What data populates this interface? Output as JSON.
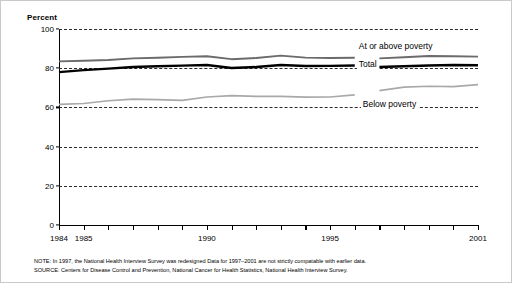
{
  "chart_data": {
    "type": "line",
    "title": "",
    "ylabel": "Percent",
    "xlabel": "",
    "ylim": [
      0,
      100
    ],
    "yticks": [
      0,
      20,
      40,
      60,
      80,
      100
    ],
    "ytick_labels": [
      "0",
      "20",
      "40",
      "60",
      "80",
      "100"
    ],
    "grid": "horizontal-dashed",
    "xlim": [
      1984,
      2001
    ],
    "x": [
      1984,
      1985,
      1986,
      1987,
      1988,
      1989,
      1990,
      1991,
      1992,
      1993,
      1994,
      1995,
      1996,
      1997,
      1998,
      1999,
      2000,
      2001
    ],
    "xticks": [
      1984,
      1985,
      1986,
      1987,
      1988,
      1989,
      1990,
      1991,
      1992,
      1993,
      1994,
      1995,
      1996,
      1997,
      1998,
      1999,
      2000,
      2001
    ],
    "xtick_labels_shown": [
      "1984",
      "1985",
      "1990",
      "1995",
      "2001"
    ],
    "legend_position": "inline-right",
    "series_break_year": 1997,
    "series": [
      {
        "name": "At or above poverty",
        "color": "#6b6b6b",
        "values": [
          83.5,
          83.8,
          84.2,
          85.0,
          85.3,
          85.8,
          86.1,
          84.6,
          85.2,
          86.4,
          85.4,
          85.2,
          85.3,
          85.0,
          85.6,
          86.2,
          86.1,
          85.9
        ]
      },
      {
        "name": "Total",
        "color": "#000000",
        "values": [
          78.0,
          79.0,
          79.8,
          80.6,
          81.0,
          81.3,
          81.6,
          80.1,
          80.6,
          81.6,
          81.1,
          81.2,
          81.4,
          80.6,
          81.0,
          81.4,
          81.6,
          81.5
        ]
      },
      {
        "name": "Below poverty",
        "color": "#a9a9a9",
        "values": [
          61.5,
          62.0,
          63.4,
          64.2,
          64.0,
          63.6,
          65.3,
          66.0,
          65.6,
          65.6,
          65.2,
          65.3,
          66.4,
          68.6,
          70.3,
          70.8,
          70.6,
          71.6
        ]
      }
    ]
  },
  "footnotes": {
    "note": "NOTE: In 1997, the National Health Interview Survey was redesigned Data for 1997–2001 are not strictly compatable with earlier data.",
    "source": "SOURCE: Centers for Disease Control and Prevention, National Cancer for Health Statistics, National Health Interview Survey."
  }
}
